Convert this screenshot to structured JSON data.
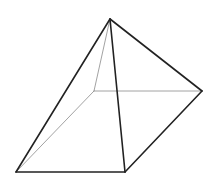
{
  "diagram": {
    "type": "wireframe-square-pyramid",
    "background": "#ffffff",
    "vertices": {
      "apex": [
        110,
        19
      ],
      "back_right": [
        202,
        91
      ],
      "front_left": [
        16,
        172
      ],
      "front_right": [
        125,
        172
      ],
      "back_left": [
        94,
        91
      ]
    },
    "visible_edge_color": "#222222",
    "hidden_edge_color": "#8a8a8a",
    "visible_edges": [
      [
        "apex",
        "front_left"
      ],
      [
        "apex",
        "front_right"
      ],
      [
        "apex",
        "back_right"
      ],
      [
        "front_left",
        "front_right"
      ],
      [
        "front_right",
        "back_right"
      ]
    ],
    "hidden_edges": [
      [
        "apex",
        "back_left"
      ],
      [
        "back_left",
        "front_left"
      ],
      [
        "back_left",
        "back_right"
      ]
    ]
  }
}
